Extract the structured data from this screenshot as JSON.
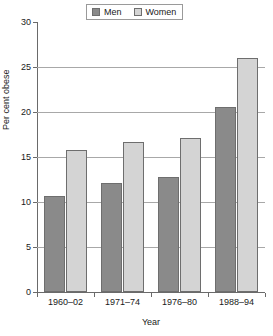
{
  "chart_data": {
    "type": "bar",
    "title": "",
    "subtitle": "",
    "categories": [
      "1960–02",
      "1971–74",
      "1976–80",
      "1988–94"
    ],
    "series": [
      {
        "name": "Men",
        "color": "#8a8a8a",
        "values": [
          10.7,
          12.1,
          12.8,
          20.6
        ]
      },
      {
        "name": "Women",
        "color": "#d4d4d4",
        "values": [
          15.8,
          16.7,
          17.1,
          26.0
        ]
      }
    ],
    "xlabel": "Year",
    "ylabel": "Per cent obese",
    "ylim": [
      0,
      30
    ],
    "ytick_values": [
      0,
      5,
      10,
      15,
      20,
      25,
      30
    ],
    "ytick_labels": [
      "0",
      "5",
      "10",
      "15",
      "20",
      "25",
      "30"
    ],
    "grid": "horizontal",
    "legend_position": "top-center",
    "legend_boxed": true,
    "bar_border_color": "#6e6e6e",
    "axis_color": "#6a6a6a",
    "gridline_color": "#a8a8a8",
    "background_color": "#ffffff"
  },
  "legend": {
    "entries": [
      {
        "label": "Men"
      },
      {
        "label": "Women"
      }
    ]
  },
  "axes": {
    "x_title": "Year",
    "y_title": "Per cent obese"
  }
}
